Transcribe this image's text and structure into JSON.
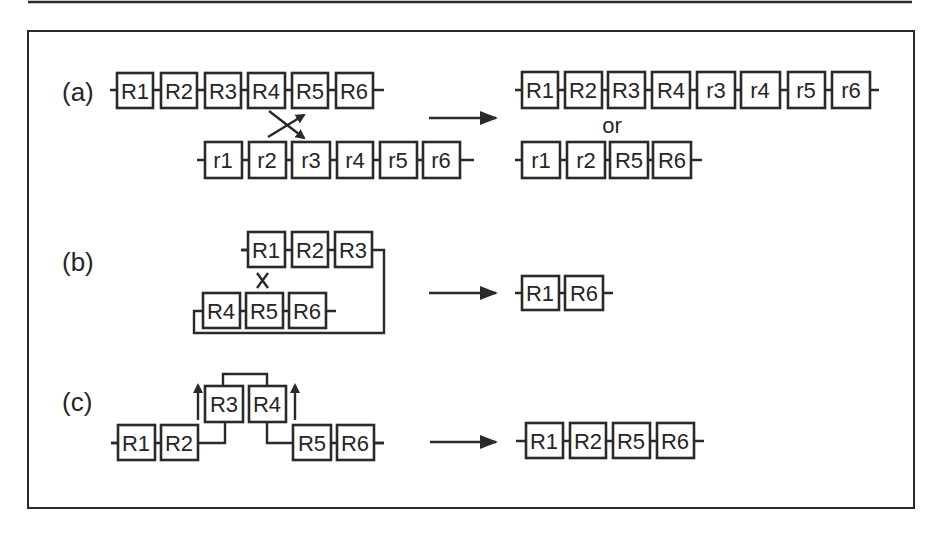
{
  "figure": {
    "panels": [
      {
        "label": "(a)",
        "input": {
          "strand_upper": [
            "R1",
            "R2",
            "R3",
            "R4",
            "R5",
            "R6"
          ],
          "strand_lower": [
            "r1",
            "r2",
            "r3",
            "r4",
            "r5",
            "r6"
          ],
          "event": "crossover between R4/R5 and r2/r3 (two crossing arrows)"
        },
        "arrow": "→",
        "output": {
          "option1": [
            "R1",
            "R2",
            "R3",
            "R4",
            "r3",
            "r4",
            "r5",
            "r6"
          ],
          "separator": "or",
          "option2": [
            "r1",
            "r2",
            "R5",
            "R6"
          ]
        }
      },
      {
        "label": "(b)",
        "input": {
          "strand_upper": [
            "R1",
            "R2",
            "R3"
          ],
          "strand_lower": [
            "R4",
            "R5",
            "R6"
          ],
          "event": "looped strand, crossover (×) between R1 and R5"
        },
        "arrow": "→",
        "output": {
          "result": [
            "R1",
            "R6"
          ]
        }
      },
      {
        "label": "(c)",
        "input": {
          "strand_left": [
            "R1",
            "R2"
          ],
          "strand_raised": [
            "R3",
            "R4"
          ],
          "strand_right": [
            "R5",
            "R6"
          ],
          "event": "R3-R4 segment excised (upward arrows)"
        },
        "arrow": "→",
        "output": {
          "result": [
            "R1",
            "R2",
            "R5",
            "R6"
          ]
        }
      }
    ]
  },
  "colors": {
    "line": "#2a2a2a",
    "background": "#ffffff",
    "text": "#262626"
  }
}
